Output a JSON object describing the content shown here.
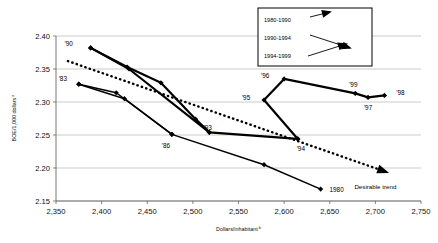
{
  "chart_data": {
    "type": "line",
    "title": "",
    "xlabel": "Dollars/inhabitant",
    "xlabel_sup": "b",
    "ylabel": "BOE/1,000 dollars",
    "ylabel_sup": "a",
    "xlim": [
      2350,
      2750
    ],
    "ylim": [
      2.15,
      2.4
    ],
    "xticks": [
      "2,350",
      "2,400",
      "2,450",
      "2,500",
      "2,550",
      "2,600",
      "2,650",
      "2,700",
      "2,750"
    ],
    "xtick_values": [
      2350,
      2400,
      2450,
      2500,
      2550,
      2600,
      2650,
      2700,
      2750
    ],
    "yticks": [
      "2.40",
      "2.35",
      "2.30",
      "2.25",
      "2.20",
      "2.15"
    ],
    "ytick_values": [
      2.4,
      2.35,
      2.3,
      2.25,
      2.2,
      2.15
    ],
    "grid": "horizontal",
    "legend_position": "top-right",
    "series": [
      {
        "name": "1980-1990",
        "style": "solid-thin",
        "points": [
          {
            "x": 2640,
            "y": 2.168,
            "label": "1980"
          },
          {
            "x": 2578,
            "y": 2.205,
            "label": ""
          },
          {
            "x": 2477,
            "y": 2.251,
            "label": "'86"
          },
          {
            "x": 2416,
            "y": 2.314,
            "label": ""
          },
          {
            "x": 2375,
            "y": 2.327,
            "label": "'83"
          }
        ]
      },
      {
        "name": "1990-1994",
        "style": "solid-thick",
        "points": [
          {
            "x": 2388,
            "y": 2.382,
            "label": "'90"
          },
          {
            "x": 2428,
            "y": 2.353,
            "label": ""
          },
          {
            "x": 2465,
            "y": 2.329,
            "label": ""
          },
          {
            "x": 2503,
            "y": 2.274,
            "label": "'93"
          },
          {
            "x": 2518,
            "y": 2.254,
            "label": ""
          },
          {
            "x": 2615,
            "y": 2.244,
            "label": "'94"
          }
        ]
      },
      {
        "name": "1994-1999",
        "style": "solid-thick",
        "points": [
          {
            "x": 2615,
            "y": 2.244,
            "label": ""
          },
          {
            "x": 2578,
            "y": 2.303,
            "label": "'95"
          },
          {
            "x": 2600,
            "y": 2.335,
            "label": "'96"
          },
          {
            "x": 2678,
            "y": 2.313,
            "label": "'99"
          },
          {
            "x": 2692,
            "y": 2.307,
            "label": "'97"
          },
          {
            "x": 2710,
            "y": 2.31,
            "label": "'98"
          }
        ]
      },
      {
        "name": "1983-1990-alt",
        "style": "solid-thin",
        "points": [
          {
            "x": 2375,
            "y": 2.327,
            "label": ""
          },
          {
            "x": 2425,
            "y": 2.305,
            "label": ""
          },
          {
            "x": 2477,
            "y": 2.251,
            "label": ""
          }
        ]
      },
      {
        "name": "1990-1993-alt",
        "style": "solid-thick",
        "points": [
          {
            "x": 2388,
            "y": 2.382,
            "label": ""
          },
          {
            "x": 2430,
            "y": 2.35,
            "label": ""
          },
          {
            "x": 2518,
            "y": 2.254,
            "label": ""
          }
        ]
      }
    ],
    "trend": {
      "label": "Desirable trend",
      "style": "dotted",
      "start": {
        "x": 2363,
        "y": 2.362
      },
      "end": {
        "x": 2712,
        "y": 2.194
      }
    },
    "legend": [
      {
        "label": "1980-1990",
        "marker": "arrow-down-right"
      },
      {
        "label": "1990-1994",
        "marker": "arrow-right"
      },
      {
        "label": "1994-1999",
        "marker": "arrow-up-right"
      }
    ],
    "point_labels": [
      {
        "text": "'90",
        "x": 2388,
        "y": 2.382,
        "dx": -22,
        "dy": -2
      },
      {
        "text": "'83",
        "x": 2375,
        "y": 2.327,
        "dx": -16,
        "dy": -3
      },
      {
        "text": "'86",
        "x": 2477,
        "y": 2.251,
        "dx": -6,
        "dy": 14
      },
      {
        "text": "'93",
        "x": 2503,
        "y": 2.274,
        "dx": 12,
        "dy": 11
      },
      {
        "text": "1980",
        "x": 2640,
        "y": 2.168,
        "dx": 16,
        "dy": 3
      },
      {
        "text": "'94",
        "x": 2615,
        "y": 2.244,
        "dx": 3,
        "dy": 12
      },
      {
        "text": "'95",
        "x": 2578,
        "y": 2.303,
        "dx": -18,
        "dy": 0
      },
      {
        "text": "'96",
        "x": 2600,
        "y": 2.335,
        "dx": -19,
        "dy": -1
      },
      {
        "text": "'99",
        "x": 2678,
        "y": 2.313,
        "dx": -2,
        "dy": -6
      },
      {
        "text": "'97",
        "x": 2692,
        "y": 2.307,
        "dx": 0,
        "dy": 13
      },
      {
        "text": "'98",
        "x": 2710,
        "y": 2.31,
        "dx": 16,
        "dy": 0
      }
    ]
  }
}
